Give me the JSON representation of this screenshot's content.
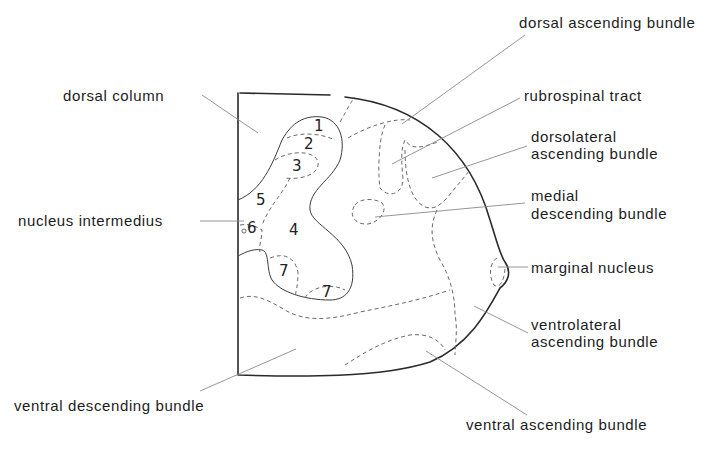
{
  "figure": {
    "type": "spinal cord cross-section (hemisection) schematic",
    "labels": {
      "dorsal_column": "dorsal column",
      "dorsal_ascending_bundle": "dorsal ascending bundle",
      "rubrospinal_tract": "rubrospinal tract",
      "dorsolateral_ascending_bundle_1": "dorsolateral",
      "dorsolateral_ascending_bundle_2": "ascending bundle",
      "medial_descending_bundle_1": "medial",
      "medial_descending_bundle_2": "descending bundle",
      "nucleus_intermedius": "nucleus intermedius",
      "marginal_nucleus": "marginal nucleus",
      "ventrolateral_ascending_bundle_1": "ventrolateral",
      "ventrolateral_ascending_bundle_2": "ascending bundle",
      "ventral_descending_bundle": "ventral descending bundle",
      "ventral_ascending_bundle": "ventral ascending bundle"
    },
    "laminae": [
      "1",
      "2",
      "3",
      "4",
      "5",
      "6",
      "7",
      "7"
    ],
    "colors": {
      "outline": "#2a2a2a",
      "dashed": "#6a6a6a",
      "leader": "#8a8a8a",
      "text": "#1c1c1c",
      "background": "#ffffff"
    }
  }
}
